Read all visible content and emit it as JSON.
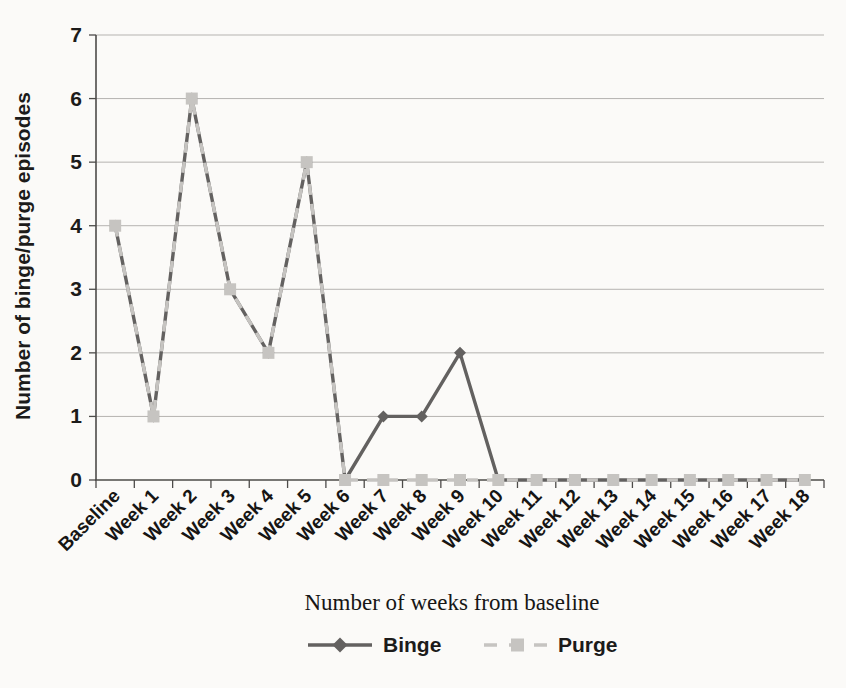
{
  "chart_data": {
    "type": "line",
    "categories": [
      "Baseline",
      "Week 1",
      "Week 2",
      "Week 3",
      "Week 4",
      "Week 5",
      "Week 6",
      "Week 7",
      "Week 8",
      "Week 9",
      "Week 10",
      "Week 11",
      "Week 12",
      "Week 13",
      "Week 14",
      "Week 15",
      "Week 16",
      "Week 17",
      "Week 18"
    ],
    "series": [
      {
        "name": "Binge",
        "values": [
          4,
          1,
          6,
          3,
          2,
          5,
          0,
          1,
          1,
          2,
          0,
          0,
          0,
          0,
          0,
          0,
          0,
          0,
          0
        ],
        "color": "#636160",
        "marker": "diamond",
        "line_style": "solid"
      },
      {
        "name": "Purge",
        "values": [
          4,
          1,
          6,
          3,
          2,
          5,
          0,
          0,
          0,
          0,
          0,
          0,
          0,
          0,
          0,
          0,
          0,
          0,
          0
        ],
        "color": "#c6c4c1",
        "marker": "square",
        "line_style": "dashed"
      }
    ],
    "xlabel": "Number of weeks from baseline",
    "ylabel": "Number of binge/purge episodes",
    "ylim": [
      0,
      7
    ],
    "ytick_step": 1,
    "grid": "horizontal-only",
    "legend_position": "bottom-center",
    "colors": {
      "gridline": "#b5b3b0",
      "axis": "#4d4b49",
      "background": "#fbfaf8"
    }
  }
}
